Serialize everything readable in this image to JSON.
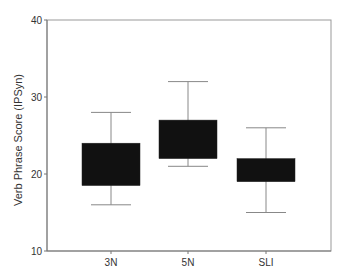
{
  "chart_data": {
    "type": "boxplot",
    "title": "",
    "xlabel": "",
    "ylabel": "Verb Phrase Score (IPSyn)",
    "ylim": [
      10,
      40
    ],
    "yticks": [
      10,
      20,
      30,
      40
    ],
    "grid": false,
    "legend": null,
    "categories": [
      "3N",
      "5N",
      "SLI"
    ],
    "series": [
      {
        "name": "3N",
        "whisker_low": 16,
        "q1": 18.5,
        "q3": 24,
        "whisker_high": 28
      },
      {
        "name": "5N",
        "whisker_low": 21,
        "q1": 22,
        "q3": 27,
        "whisker_high": 32
      },
      {
        "name": "SLI",
        "whisker_low": 15,
        "q1": 19,
        "q3": 22,
        "whisker_high": 26
      }
    ],
    "colors": {
      "box_fill": "#111111",
      "whisker": "#888888",
      "axis": "#777777",
      "frame": "#999999",
      "text": "#333333"
    }
  }
}
